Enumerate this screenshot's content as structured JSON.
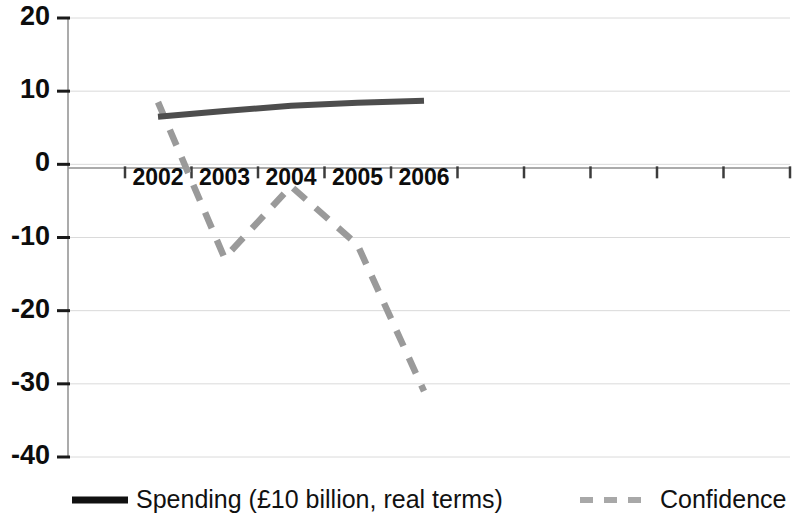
{
  "chart_data": {
    "type": "line",
    "title": "",
    "xlabel": "",
    "ylabel": "",
    "xlim": [
      2001.5,
      2006.5
    ],
    "ylim": [
      -40,
      20
    ],
    "yticks": [
      20,
      10,
      0,
      -10,
      -20,
      -30,
      -40
    ],
    "ytick_labels": [
      "20",
      "10",
      "0",
      "-10",
      "-20",
      "-30",
      "-40"
    ],
    "categories": [
      2002,
      2003,
      2004,
      2005,
      2006
    ],
    "xtick_labels": [
      "2002",
      "2003",
      "2004",
      "2005",
      "2006"
    ],
    "grid": true,
    "legend_position": "bottom",
    "series": [
      {
        "name": "Spending (£10 billion, real terms)",
        "style": "solid",
        "color": "#4d4d4d",
        "values": [
          6.5,
          7.3,
          8.0,
          8.4,
          8.7
        ]
      },
      {
        "name": "Confidence",
        "style": "dashed",
        "color": "#9a9a9a",
        "values": [
          8.5,
          -12.8,
          -3.0,
          -11.0,
          -31.0
        ]
      }
    ]
  },
  "axes": {
    "y_labels": [
      "20",
      "10",
      "0",
      "-10",
      "-20",
      "-30",
      "-40"
    ],
    "x_labels": [
      "2002",
      "2003",
      "2004",
      "2005",
      "2006"
    ]
  },
  "legend": {
    "items": [
      {
        "label": "Spending (£10 billion, real terms)",
        "style": "solid",
        "color": "#111111"
      },
      {
        "label": "Confidence",
        "style": "dashed",
        "color": "#a8a8a8"
      }
    ]
  }
}
